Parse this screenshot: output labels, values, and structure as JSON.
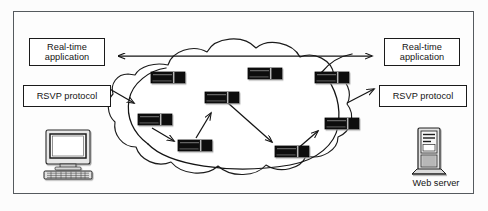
{
  "figure": {
    "background_color": "#fcfcfc",
    "frame_color": "#555a5e",
    "ink_color": "#141414"
  },
  "labels": {
    "realtime_application_left": "Real-time\napplication",
    "realtime_application_left_line1": "Real-time",
    "realtime_application_left_line2": "application",
    "rsvp_protocol_left": "RSVP protocol",
    "realtime_application_right_line1": "Real-time",
    "realtime_application_right_line2": "application",
    "rsvp_protocol_right": "RSVP protocol",
    "web_server": "Web server",
    "host_computer": "",
    "cloud": ""
  },
  "icons": {
    "host": "desktop-computer-icon",
    "server": "tower-server-icon",
    "router": "router-icon",
    "cloud": "network-cloud-icon",
    "flow_arrow": "arrow-icon",
    "data_path_arrow": "double-headed-arrow-icon"
  },
  "network": {
    "cloud_label": "",
    "router_count": 8,
    "routers": [
      {
        "id": "r1",
        "name": "router-top-left",
        "x": 151,
        "y": 72
      },
      {
        "id": "r2",
        "name": "router-top-center",
        "x": 248,
        "y": 68
      },
      {
        "id": "r3",
        "name": "router-top-right",
        "x": 315,
        "y": 72
      },
      {
        "id": "r4",
        "name": "router-center",
        "x": 205,
        "y": 92
      },
      {
        "id": "r5",
        "name": "router-mid-left",
        "x": 138,
        "y": 114
      },
      {
        "id": "r6",
        "name": "router-mid-right",
        "x": 325,
        "y": 118
      },
      {
        "id": "r7",
        "name": "router-bottom-left",
        "x": 178,
        "y": 140
      },
      {
        "id": "r8",
        "name": "router-bottom-right",
        "x": 275,
        "y": 146
      }
    ],
    "router_size": {
      "width": 34,
      "height": 11
    },
    "flows": [
      {
        "from": "rsvp-left-box",
        "to": "router-mid-left",
        "kind": "arrow"
      },
      {
        "from": "router-mid-left",
        "to": "router-bottom-left",
        "kind": "arrow"
      },
      {
        "from": "router-bottom-left",
        "to": "router-center",
        "kind": "arrow"
      },
      {
        "from": "router-center",
        "to": "router-bottom-right",
        "kind": "arrow"
      },
      {
        "from": "router-bottom-right",
        "to": "router-mid-right",
        "kind": "arrow"
      },
      {
        "from": "router-mid-right",
        "to": "rsvp-right-box",
        "kind": "arrow"
      }
    ],
    "data_path": {
      "from": "realtime-application-left",
      "to": "realtime-application-right",
      "kind": "double-headed-arrow"
    }
  }
}
